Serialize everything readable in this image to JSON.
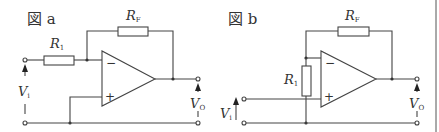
{
  "colors": {
    "wire": "#444444",
    "text": "#333333",
    "background": "#ffffff"
  },
  "figures": [
    {
      "id": "a",
      "title": "図 a",
      "labels": {
        "rf_main": "R",
        "rf_sub": "F",
        "r1_main": "R",
        "r1_sub": "1",
        "vi_main": "V",
        "vi_sub": "i",
        "vo_main": "V",
        "vo_sub": "O",
        "minus": "−",
        "plus": "+"
      },
      "description": "Inverting amplifier: input via R1 to inverting input, RF feedback from output, non-inverting input grounded"
    },
    {
      "id": "b",
      "title": "図 b",
      "labels": {
        "rf_main": "R",
        "rf_sub": "F",
        "r1_main": "R",
        "r1_sub": "1",
        "vi_main": "V",
        "vi_sub": "i",
        "vo_main": "V",
        "vo_sub": "O",
        "minus": "−",
        "plus": "+"
      },
      "description": "Non-inverting amplifier: input to non-inverting input, R1 from inverting input to ground, RF feedback from output"
    }
  ]
}
